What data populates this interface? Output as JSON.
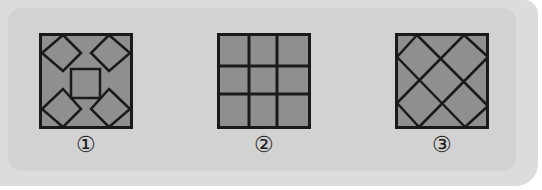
{
  "figures": [
    {
      "id": 1,
      "label": "①",
      "pattern": "four-diamonds-center-square"
    },
    {
      "id": 2,
      "label": "②",
      "pattern": "3x3-grid"
    },
    {
      "id": 3,
      "label": "③",
      "pattern": "diagonal-lattice"
    }
  ],
  "colors": {
    "fill": "#8f8f8f",
    "stroke": "#1a1a1a",
    "panel": "#d2d2d2",
    "background": "#dcdcdc"
  }
}
